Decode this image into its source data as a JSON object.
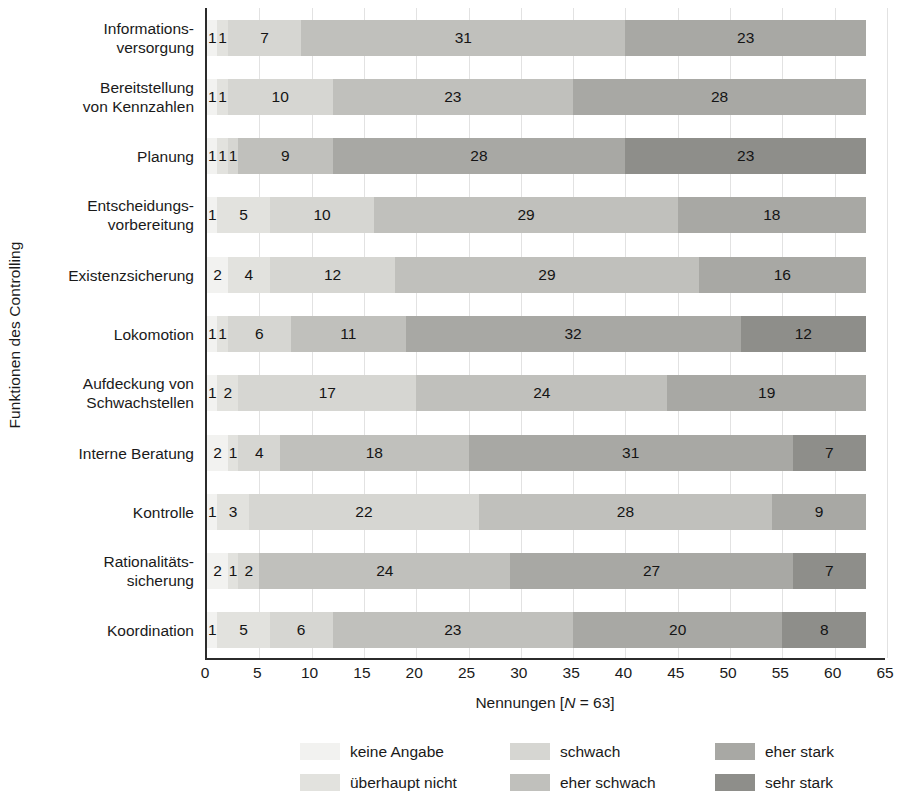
{
  "chart_data": {
    "type": "bar",
    "orientation": "horizontal",
    "stacked": true,
    "title": "",
    "ylabel": "Funktionen des Controlling",
    "xlabel_parts": {
      "before": "Nennungen [",
      "italic": "N",
      "after": " = 63]"
    },
    "xlabel": "Nennungen [N = 63]",
    "xlim": [
      0,
      65
    ],
    "xticks": [
      0,
      5,
      10,
      15,
      20,
      25,
      30,
      35,
      40,
      45,
      50,
      55,
      60,
      65
    ],
    "grid": true,
    "legend_position": "bottom",
    "categories": [
      "Informations-\nversorgung",
      "Bereitstellung\nvon Kennzahlen",
      "Planung",
      "Entscheidungs-\nvorbereitung",
      "Existenzsicherung",
      "Lokomotion",
      "Aufdeckung von\nSchwachstellen",
      "Interne Beratung",
      "Kontrolle",
      "Rationalitäts-\nsicherung",
      "Koordination"
    ],
    "series": [
      {
        "name": "keine Angabe",
        "color": "#f2f2f0",
        "values": [
          1,
          1,
          1,
          1,
          2,
          1,
          1,
          2,
          1,
          2,
          1
        ]
      },
      {
        "name": "überhaupt nicht",
        "color": "#e2e2de",
        "values": [
          1,
          1,
          1,
          5,
          4,
          1,
          2,
          1,
          3,
          1,
          5
        ]
      },
      {
        "name": "schwach",
        "color": "#d6d6d2",
        "values": [
          7,
          10,
          1,
          10,
          12,
          6,
          17,
          4,
          22,
          2,
          6
        ]
      },
      {
        "name": "eher schwach",
        "color": "#c0c0bc",
        "values": [
          31,
          23,
          9,
          29,
          29,
          11,
          24,
          18,
          28,
          24,
          23
        ]
      },
      {
        "name": "eher stark",
        "color": "#a8a8a4",
        "values": [
          23,
          28,
          28,
          18,
          16,
          32,
          19,
          31,
          9,
          27,
          20
        ]
      },
      {
        "name": "sehr stark",
        "color": "#8e8e8a",
        "values": [
          0,
          0,
          23,
          0,
          0,
          12,
          0,
          7,
          0,
          7,
          8
        ]
      }
    ],
    "bar_segments": [
      {
        "category": "Informations-\nversorgung",
        "segments": [
          1,
          1,
          7,
          31,
          23
        ],
        "labels": [
          "1",
          "1",
          "7",
          "31",
          "23"
        ],
        "total": 63
      },
      {
        "category": "Bereitstellung\nvon Kennzahlen",
        "segments": [
          1,
          1,
          10,
          23,
          28
        ],
        "labels": [
          "1",
          "1",
          "10",
          "23",
          "28"
        ],
        "total": 63
      },
      {
        "category": "Planung",
        "segments": [
          1,
          1,
          1,
          9,
          28,
          23
        ],
        "labels": [
          "1",
          "1",
          "1",
          "9",
          "28",
          "23"
        ],
        "total": 63
      },
      {
        "category": "Entscheidungs-\nvorbereitung",
        "segments": [
          1,
          5,
          10,
          29,
          18
        ],
        "labels": [
          "1",
          "5",
          "10",
          "29",
          "18"
        ],
        "total": 63
      },
      {
        "category": "Existenzsicherung",
        "segments": [
          2,
          4,
          12,
          29,
          16
        ],
        "labels": [
          "2",
          "4",
          "12",
          "29",
          "16"
        ],
        "total": 63
      },
      {
        "category": "Lokomotion",
        "segments": [
          1,
          1,
          6,
          11,
          32,
          12
        ],
        "labels": [
          "1",
          "1",
          "6",
          "11",
          "32",
          "12"
        ],
        "total": 63
      },
      {
        "category": "Aufdeckung von\nSchwachstellen",
        "segments": [
          1,
          2,
          17,
          24,
          19
        ],
        "labels": [
          "1",
          "2",
          "17",
          "24",
          "19"
        ],
        "total": 63
      },
      {
        "category": "Interne Beratung",
        "segments": [
          2,
          1,
          4,
          18,
          31,
          7
        ],
        "labels": [
          "2",
          "1",
          "4",
          "18",
          "31",
          "7"
        ],
        "total": 63
      },
      {
        "category": "Kontrolle",
        "segments": [
          1,
          3,
          22,
          28,
          9
        ],
        "labels": [
          "1",
          "3",
          "22",
          "28",
          "9"
        ],
        "total": 63
      },
      {
        "category": "Rationalitäts-\nsicherung",
        "segments": [
          2,
          1,
          2,
          24,
          27,
          7
        ],
        "labels": [
          "2",
          "1",
          "2",
          "24",
          "27",
          "7"
        ],
        "total": 63
      },
      {
        "category": "Koordination",
        "segments": [
          1,
          5,
          6,
          23,
          20,
          8
        ],
        "labels": [
          "1",
          "5",
          "6",
          "23",
          "20",
          "8"
        ],
        "total": 63
      }
    ],
    "series_index_per_bar": [
      [
        0,
        1,
        2,
        3,
        4
      ],
      [
        0,
        1,
        2,
        3,
        4
      ],
      [
        0,
        1,
        2,
        3,
        4,
        5
      ],
      [
        0,
        1,
        2,
        3,
        4
      ],
      [
        0,
        1,
        2,
        3,
        4
      ],
      [
        0,
        1,
        2,
        3,
        4,
        5
      ],
      [
        0,
        1,
        2,
        3,
        4
      ],
      [
        0,
        1,
        2,
        3,
        4,
        5
      ],
      [
        0,
        1,
        2,
        3,
        4
      ],
      [
        0,
        1,
        2,
        3,
        4,
        5
      ],
      [
        0,
        1,
        2,
        3,
        4,
        5
      ]
    ],
    "legend": [
      {
        "label": "keine Angabe",
        "color": "#f2f2f0"
      },
      {
        "label": "schwach",
        "color": "#d6d6d2"
      },
      {
        "label": "eher stark",
        "color": "#a8a8a4"
      },
      {
        "label": "überhaupt nicht",
        "color": "#e2e2de"
      },
      {
        "label": "eher schwach",
        "color": "#c0c0bc"
      },
      {
        "label": "sehr stark",
        "color": "#8e8e8a"
      }
    ]
  }
}
